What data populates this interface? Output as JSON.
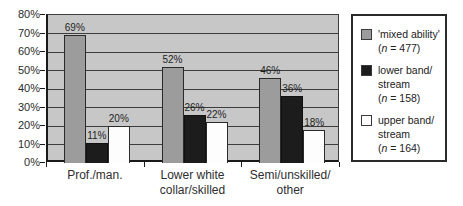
{
  "figure": {
    "background": "#ffffff",
    "plot_background": "#c7c7c7",
    "gridline_color": "#3d3d3d",
    "axis_color": "#1a1a1a",
    "text_color": "#2b2b2b"
  },
  "chart_data": {
    "type": "bar",
    "title": "",
    "xlabel": "",
    "ylabel": "",
    "ylim": [
      0,
      80
    ],
    "ytick_step": 10,
    "ytick_labels": [
      "0%",
      "10%",
      "20%",
      "30%",
      "40%",
      "50%",
      "60%",
      "70%",
      "80%"
    ],
    "grid": true,
    "legend_position": "right",
    "categories": [
      "Prof./man.",
      "Lower white collar/skilled",
      "Semi/unskilled/other"
    ],
    "category_lines": [
      [
        "Prof./man."
      ],
      [
        "Lower white",
        "collar/skilled"
      ],
      [
        "Semi/unskilled/",
        "other"
      ]
    ],
    "series": [
      {
        "name": "'mixed ability' (n = 477)",
        "color": "#9c9c9c",
        "border_color": "#2a2a2a",
        "values": [
          69,
          52,
          46
        ],
        "labels": [
          "69%",
          "52%",
          "46%"
        ]
      },
      {
        "name": "lower band/stream (n = 158)",
        "color": "#1c1c1c",
        "border_color": "#111111",
        "values": [
          11,
          26,
          36
        ],
        "labels": [
          "11%",
          "26%",
          "36%"
        ]
      },
      {
        "name": "upper band/stream (n = 164)",
        "color": "#fdfdfd",
        "border_color": "#2a2a2a",
        "values": [
          20,
          22,
          18
        ],
        "labels": [
          "20%",
          "22%",
          "18%"
        ]
      }
    ]
  },
  "legend": {
    "items": [
      {
        "swatch_color": "#9c9c9c",
        "lines": [
          "'mixed ability'",
          "(n = 477)"
        ]
      },
      {
        "swatch_color": "#1c1c1c",
        "lines": [
          "lower band/",
          "stream",
          "(n = 158)"
        ]
      },
      {
        "swatch_color": "#fdfdfd",
        "lines": [
          "upper band/",
          "stream",
          "(n = 164)"
        ]
      }
    ]
  }
}
